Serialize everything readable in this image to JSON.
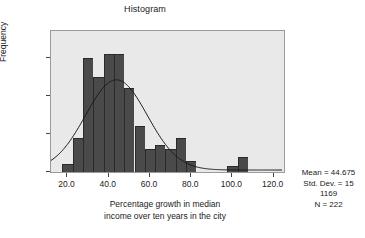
{
  "chart_data": {
    "type": "bar",
    "title": "Histogram",
    "xlabel": "Percentage growth in median income over ten years in the city",
    "ylabel": "Frequency",
    "xlim": [
      12,
      125
    ],
    "ylim": [
      0,
      37
    ],
    "grid": false,
    "bin_width": 5,
    "bin_starts": [
      17.5,
      22.5,
      27.5,
      32.5,
      37.5,
      42.5,
      47.5,
      52.5,
      57.5,
      62.5,
      67.5,
      72.5,
      77.5,
      82.5,
      87.5,
      92.5,
      97.5,
      102.5
    ],
    "categories": [
      "17.5-22.5",
      "22.5-27.5",
      "27.5-32.5",
      "32.5-37.5",
      "37.5-42.5",
      "42.5-47.5",
      "47.5-52.5",
      "52.5-57.5",
      "57.5-62.5",
      "62.5-67.5",
      "67.5-72.5",
      "72.5-77.5",
      "77.5-82.5",
      "82.5-87.5",
      "87.5-92.5",
      "92.5-97.5",
      "97.5-102.5",
      "102.5-107.5"
    ],
    "values": [
      2,
      9,
      30,
      25,
      31,
      31,
      22,
      12,
      6,
      7,
      6,
      9,
      3,
      0,
      0,
      0,
      1.5,
      4
    ],
    "xticks": [
      "20.0",
      "40.0",
      "60.0",
      "80.0",
      "100.0",
      "120.0"
    ],
    "xtick_values": [
      20,
      40,
      60,
      80,
      100,
      120
    ],
    "yticks": [
      "0",
      "10",
      "20",
      "30"
    ],
    "ytick_values": [
      0,
      10,
      20,
      30
    ],
    "overlay": {
      "type": "line",
      "name": "normal-curve",
      "peak_x": 44,
      "peak_y": 24
    },
    "annotations": {
      "mean_label": "Mean = 44.675",
      "stddev_label": "Std. Dev. = 15",
      "stddev_cont": "1169",
      "n_label": "N = 222"
    }
  },
  "xlabel_lines": {
    "line1": "Percentage growth in median",
    "line2": "income over ten years in the city"
  },
  "colors": {
    "bar_fill": "#4a4a4a",
    "plot_background": "#e9e9e9",
    "frame": "#9a9a9a",
    "curve": "#1a1a1a",
    "text": "#1a1a1a"
  }
}
